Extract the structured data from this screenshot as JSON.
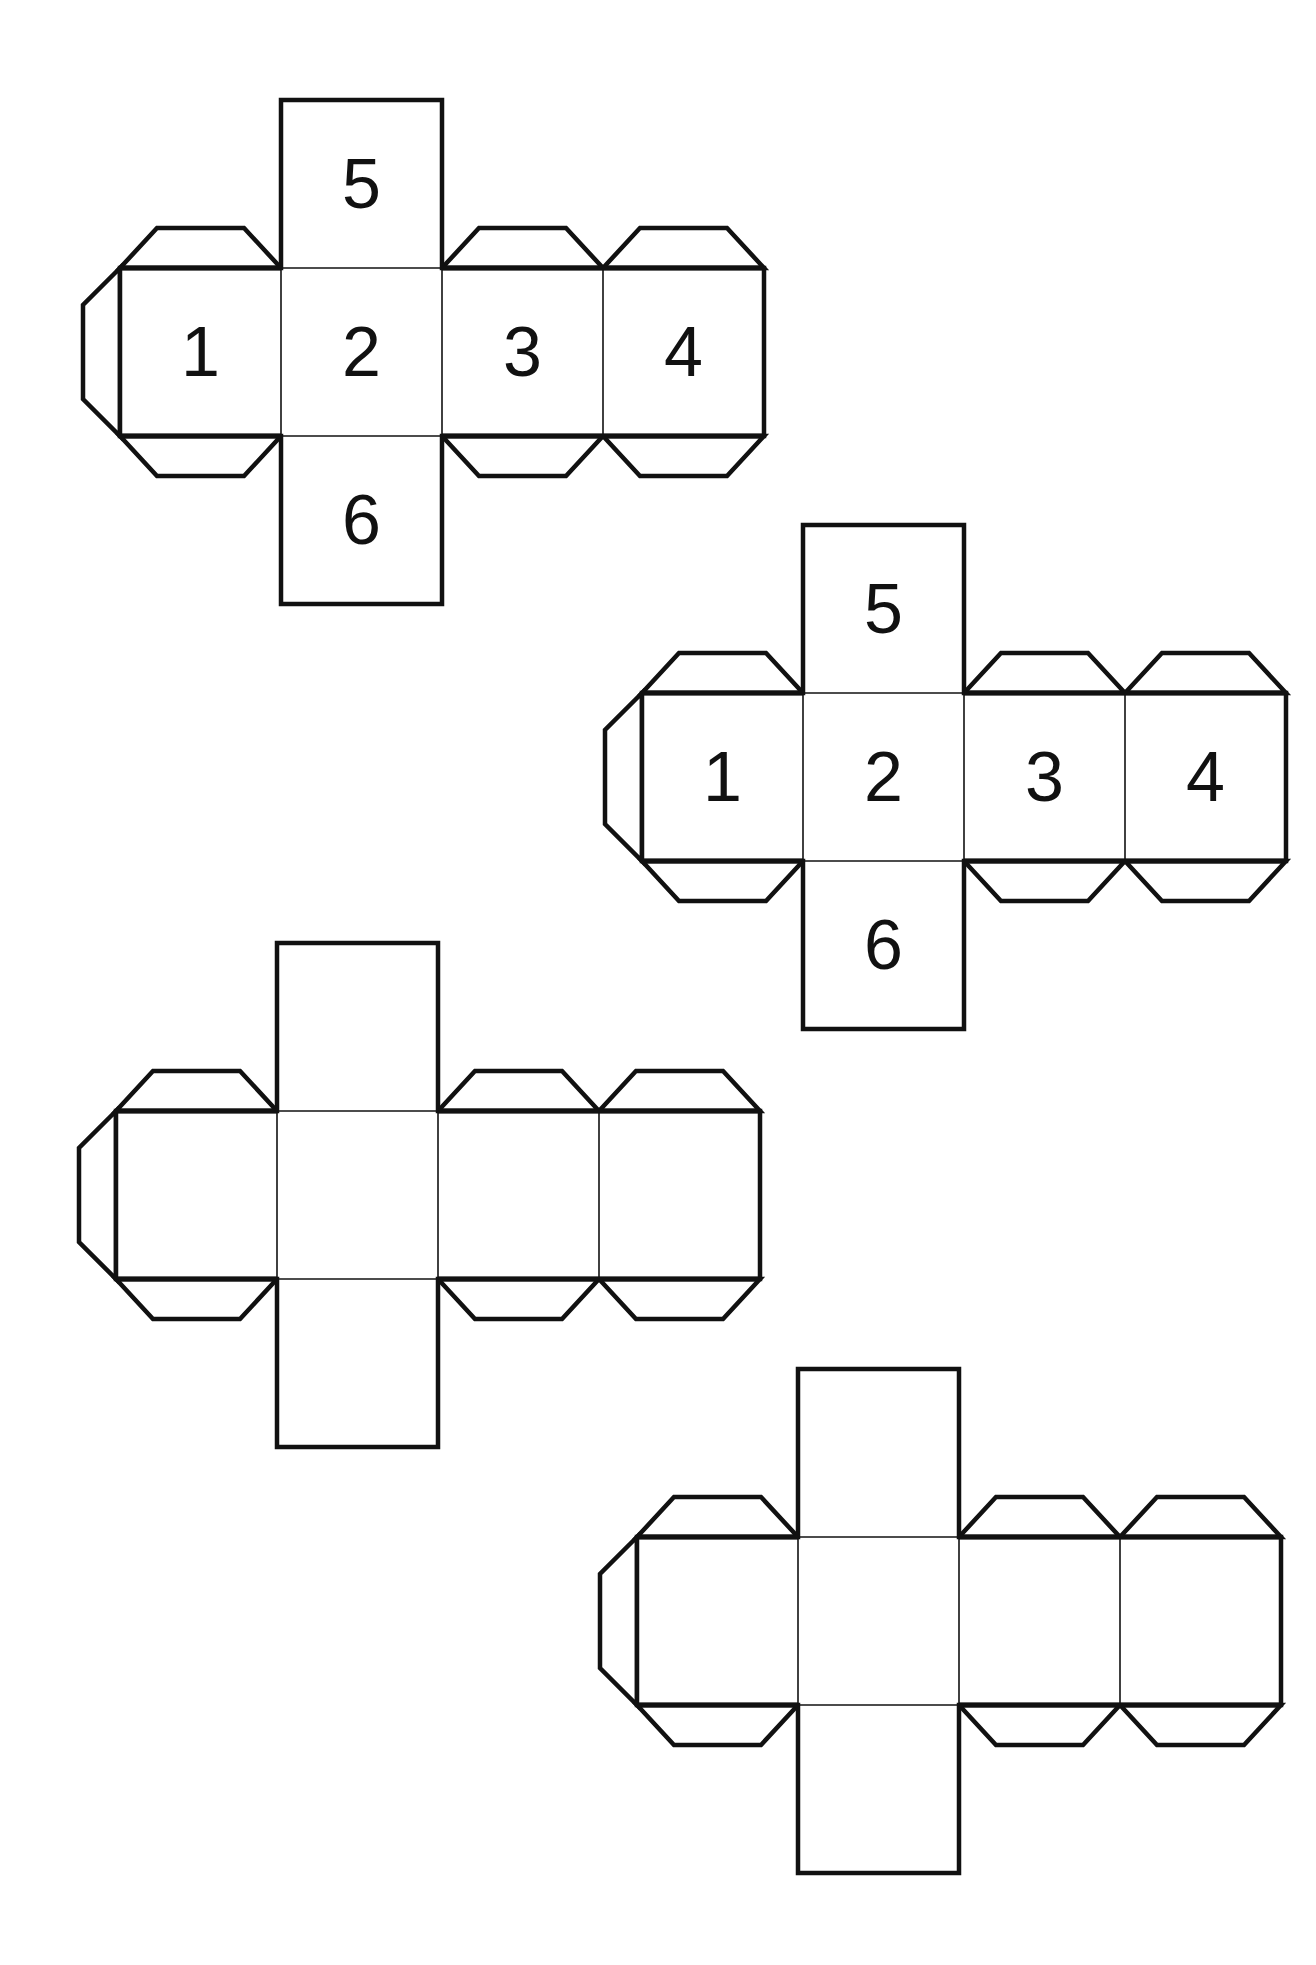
{
  "page": {
    "background": "#ffffff",
    "line_color": "#111111"
  },
  "geometry": {
    "face_width": 161,
    "face_height": 168,
    "tab_depth": 40,
    "tab_inset": 37
  },
  "nets": [
    {
      "name": "cube-net-1",
      "x": 120,
      "y": 100,
      "labeled": true,
      "labels": {
        "top": "5",
        "left": "1",
        "center": "2",
        "right1": "3",
        "right2": "4",
        "bottom": "6"
      }
    },
    {
      "name": "cube-net-2",
      "x": 642,
      "y": 525,
      "labeled": true,
      "labels": {
        "top": "5",
        "left": "1",
        "center": "2",
        "right1": "3",
        "right2": "4",
        "bottom": "6"
      }
    },
    {
      "name": "cube-net-3",
      "x": 116,
      "y": 943,
      "labeled": false,
      "labels": {
        "top": "",
        "left": "",
        "center": "",
        "right1": "",
        "right2": "",
        "bottom": ""
      }
    },
    {
      "name": "cube-net-4",
      "x": 637,
      "y": 1369,
      "labeled": false,
      "labels": {
        "top": "",
        "left": "",
        "center": "",
        "right1": "",
        "right2": "",
        "bottom": ""
      }
    }
  ]
}
